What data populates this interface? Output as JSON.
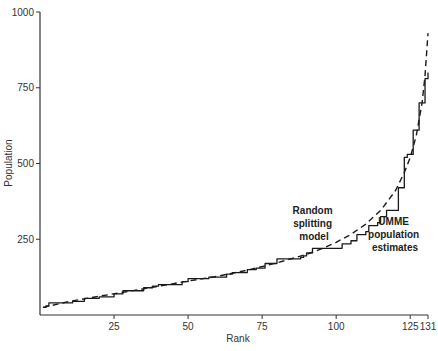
{
  "chart_data": {
    "type": "line",
    "title": "",
    "xlabel": "Rank",
    "ylabel": "Population",
    "xlim": [
      0,
      131
    ],
    "ylim": [
      0,
      1000
    ],
    "grid": false,
    "legend": "none (inline annotations)",
    "x_ticks": [
      25,
      50,
      75,
      100,
      125,
      131
    ],
    "y_ticks": [
      250,
      500,
      750,
      1000
    ],
    "series": [
      {
        "name": "UMME population estimates",
        "style": "solid-step",
        "points": [
          [
            1,
            25
          ],
          [
            2,
            30
          ],
          [
            3,
            40
          ],
          [
            7,
            40
          ],
          [
            11,
            45
          ],
          [
            14,
            45
          ],
          [
            15,
            55
          ],
          [
            19,
            55
          ],
          [
            20,
            60
          ],
          [
            24,
            60
          ],
          [
            25,
            70
          ],
          [
            27,
            70
          ],
          [
            28,
            80
          ],
          [
            33,
            80
          ],
          [
            35,
            90
          ],
          [
            38,
            95
          ],
          [
            40,
            100
          ],
          [
            47,
            100
          ],
          [
            48,
            110
          ],
          [
            50,
            120
          ],
          [
            57,
            125
          ],
          [
            62,
            125
          ],
          [
            63,
            135
          ],
          [
            65,
            140
          ],
          [
            69,
            140
          ],
          [
            70,
            150
          ],
          [
            73,
            155
          ],
          [
            76,
            170
          ],
          [
            80,
            185
          ],
          [
            88,
            190
          ],
          [
            89,
            195
          ],
          [
            90,
            205
          ],
          [
            92,
            220
          ],
          [
            100,
            220
          ],
          [
            102,
            235
          ],
          [
            105,
            245
          ],
          [
            107,
            265
          ],
          [
            110,
            275
          ],
          [
            111,
            295
          ],
          [
            114,
            305
          ],
          [
            115,
            325
          ],
          [
            117,
            345
          ],
          [
            120,
            345
          ],
          [
            121,
            420
          ],
          [
            123,
            520
          ],
          [
            124,
            530
          ],
          [
            126,
            610
          ],
          [
            128,
            700
          ],
          [
            130,
            780
          ],
          [
            131,
            800
          ]
        ]
      },
      {
        "name": "Random splitting model",
        "style": "dashed",
        "points": [
          [
            1,
            25
          ],
          [
            10,
            45
          ],
          [
            20,
            62
          ],
          [
            30,
            78
          ],
          [
            40,
            95
          ],
          [
            50,
            112
          ],
          [
            60,
            128
          ],
          [
            70,
            148
          ],
          [
            80,
            172
          ],
          [
            90,
            200
          ],
          [
            95,
            218
          ],
          [
            100,
            240
          ],
          [
            105,
            266
          ],
          [
            110,
            300
          ],
          [
            115,
            345
          ],
          [
            120,
            410
          ],
          [
            123,
            470
          ],
          [
            125,
            520
          ],
          [
            127,
            590
          ],
          [
            129,
            700
          ],
          [
            130,
            790
          ],
          [
            131,
            930
          ]
        ]
      }
    ],
    "annotations": [
      {
        "text": "Random splitting model",
        "lines": [
          "Random",
          "splitting",
          "model"
        ],
        "near_rank": 90,
        "near_value": 280
      },
      {
        "text": "UMME population estimates",
        "lines": [
          "UMME",
          "population",
          "estimates"
        ],
        "near_rank": 118,
        "near_value": 260
      }
    ]
  },
  "labels": {
    "xlabel": "Rank",
    "ylabel": "Population",
    "annot_random": [
      "Random",
      "splitting",
      "model"
    ],
    "annot_umme": [
      "UMME",
      "population",
      "estimates"
    ]
  }
}
